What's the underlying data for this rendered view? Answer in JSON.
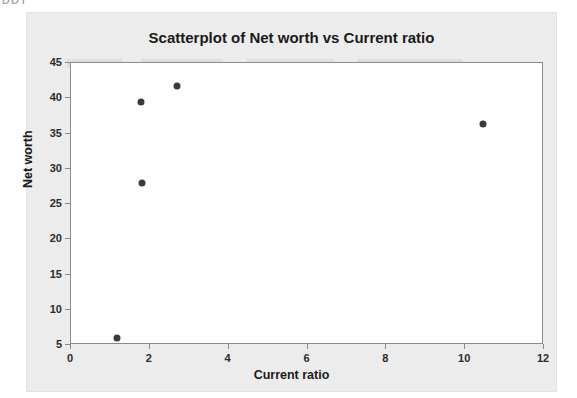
{
  "artifacts": {
    "top_left_fragment": "DDT"
  },
  "chart_data": {
    "type": "scatter",
    "title": "Scatterplot of Net worth vs Current ratio",
    "xlabel": "Current ratio",
    "ylabel": "Net worth",
    "xlim": [
      0,
      12
    ],
    "ylim": [
      5,
      45
    ],
    "xticks": [
      "0",
      "2",
      "4",
      "6",
      "8",
      "10",
      "12"
    ],
    "xtick_values": [
      0,
      2,
      4,
      6,
      8,
      10,
      12
    ],
    "yticks": [
      "5",
      "10",
      "15",
      "20",
      "25",
      "30",
      "35",
      "40",
      "45"
    ],
    "ytick_values": [
      5,
      10,
      15,
      20,
      25,
      30,
      35,
      40,
      45
    ],
    "grid": false,
    "legend": null,
    "marker_color": "#3b3b3b",
    "marker_size": 7,
    "points": [
      {
        "x": 1.17,
        "y": 6.0
      },
      {
        "x": 1.77,
        "y": 39.5
      },
      {
        "x": 1.79,
        "y": 28.0
      },
      {
        "x": 2.68,
        "y": 41.7
      },
      {
        "x": 10.44,
        "y": 36.4
      }
    ]
  }
}
